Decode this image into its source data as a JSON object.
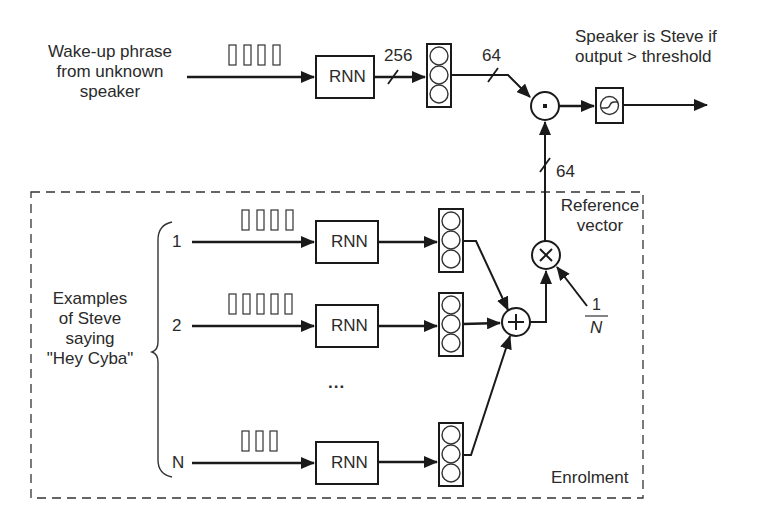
{
  "input": {
    "label_lines": [
      "Wake-up phrase",
      "from unknown",
      "speaker"
    ]
  },
  "top_branch": {
    "rnn_label": "RNN",
    "dim_rnn_out": "256",
    "dim_embed": "64",
    "frames": 4
  },
  "output": {
    "label_lines": [
      "Speaker is Steve if",
      "output > threshold"
    ]
  },
  "reference": {
    "dim": "64",
    "label_lines": [
      "Reference",
      "vector"
    ],
    "scale_num": "1",
    "scale_den": "N"
  },
  "enrolment": {
    "title": "Enrolment",
    "examples_label_lines": [
      "Examples",
      "of Steve",
      "saying",
      "\"Hey Cyba\""
    ],
    "rows": [
      {
        "index": "1",
        "rnn_label": "RNN",
        "frames": 4
      },
      {
        "index": "2",
        "rnn_label": "RNN",
        "frames": 6
      },
      {
        "index": "N",
        "rnn_label": "RNN",
        "frames": 3
      }
    ],
    "ellipsis": "..."
  },
  "operators": {
    "dot": "·",
    "sum": "+",
    "multiply": "×"
  },
  "colors": {
    "line": "#1a1a1a",
    "text": "#2a2a2a",
    "background": "#ffffff"
  }
}
